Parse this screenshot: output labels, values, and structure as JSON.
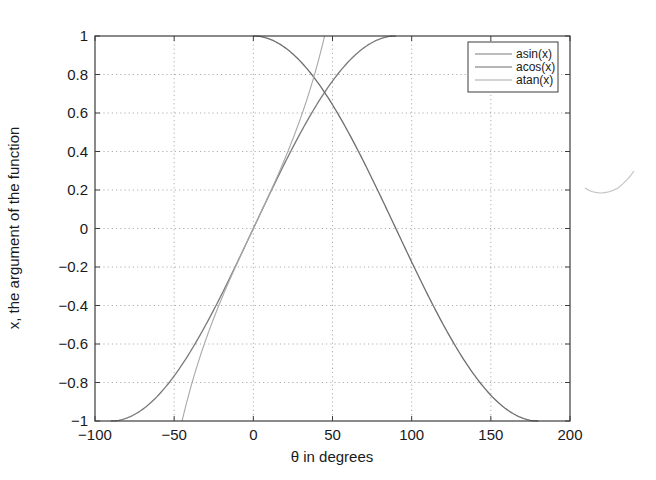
{
  "chart_data": {
    "type": "line",
    "title": "",
    "xlabel": "θ in degrees",
    "ylabel": "x, the argument of the function",
    "xlim": [
      -100,
      200
    ],
    "ylim": [
      -1,
      1
    ],
    "grid": true,
    "grid_style": "dotted",
    "legend_position": "upper-right",
    "x_ticks": [
      -100,
      -50,
      0,
      50,
      100,
      150,
      200
    ],
    "x_tick_labels": [
      "−100",
      "−50",
      "0",
      "50",
      "100",
      "150",
      "200"
    ],
    "y_ticks": [
      1,
      0.8,
      0.6,
      0.4,
      0.2,
      0,
      -0.2,
      -0.4,
      -0.6,
      -0.8,
      -1
    ],
    "y_tick_labels": [
      "1",
      "0.8",
      "0.6",
      "0.4",
      "0.2",
      "0",
      "−0.2",
      "−0.4",
      "−0.6",
      "−0.8",
      "−1"
    ],
    "series": [
      {
        "name": "asin(x)",
        "description": "x = sin(θ), θ from -90 to 90 degrees",
        "function": "sin",
        "theta_range": [
          -90,
          90
        ],
        "color": "#7a7a7a",
        "width": 1.3,
        "x": [
          -90,
          -60,
          -30,
          0,
          30,
          60,
          90
        ],
        "values": [
          -1,
          -0.866,
          -0.5,
          0,
          0.5,
          0.866,
          1
        ]
      },
      {
        "name": "acos(x)",
        "description": "x = cos(θ), θ from 0 to 180 degrees",
        "function": "cos",
        "theta_range": [
          0,
          180
        ],
        "color": "#6e6e6e",
        "width": 1.3,
        "x": [
          0,
          30,
          60,
          90,
          120,
          150,
          180
        ],
        "values": [
          1,
          0.866,
          0.5,
          0,
          -0.5,
          -0.866,
          -1
        ]
      },
      {
        "name": "atan(x)",
        "description": "x = tan(θ), θ from -45 to 45 degrees",
        "function": "tan",
        "theta_range": [
          -45,
          45
        ],
        "color": "#a8a8a8",
        "width": 1.1,
        "x": [
          -45,
          -30,
          -15,
          0,
          15,
          30,
          45
        ],
        "values": [
          -1,
          -0.577,
          -0.268,
          0,
          0.268,
          0.577,
          1
        ]
      }
    ]
  },
  "legend": {
    "items": [
      {
        "label": "asin(x)",
        "color": "#7a7a7a"
      },
      {
        "label": "acos(x)",
        "color": "#6e6e6e"
      },
      {
        "label": "atan(x)",
        "color": "#a8a8a8"
      }
    ]
  },
  "colors": {
    "axis": "#3c3c3c",
    "grid": "#9a9a9a",
    "background": "#ffffff",
    "artifact": "#c4c4c4"
  }
}
